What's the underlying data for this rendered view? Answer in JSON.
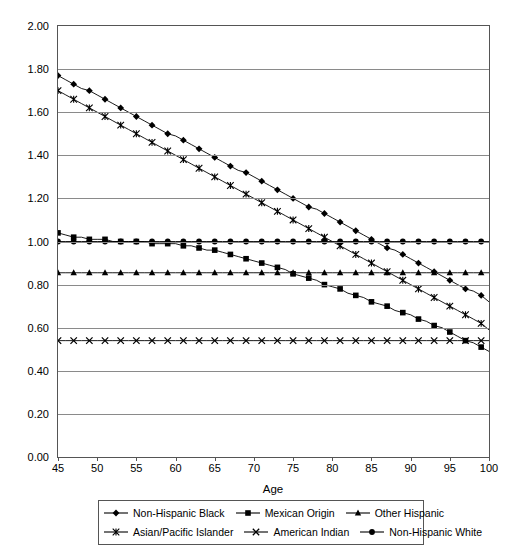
{
  "chart_data": {
    "type": "line",
    "title": "",
    "xlabel": "Age",
    "ylabel": "Hazard Ratios of Mortality",
    "xlim": [
      45,
      100
    ],
    "ylim": [
      0.0,
      2.0
    ],
    "xticks": [
      45,
      50,
      55,
      60,
      65,
      70,
      75,
      80,
      85,
      90,
      95,
      100
    ],
    "xtick_labels": [
      "45",
      "50",
      "55",
      "60",
      "65",
      "70",
      "75",
      "80",
      "85",
      "90",
      "95",
      "100"
    ],
    "yticks": [
      0.0,
      0.2,
      0.4,
      0.6,
      0.8,
      1.0,
      1.2,
      1.4,
      1.6,
      1.8,
      2.0
    ],
    "ytick_labels": [
      "0.00",
      "0.20",
      "0.40",
      "0.60",
      "0.80",
      "1.00",
      "1.20",
      "1.40",
      "1.60",
      "1.80",
      "2.00"
    ],
    "grid": "horizontal",
    "legend_position": "below",
    "legend_columns": 3,
    "marker_step_years": 1.375,
    "series": [
      {
        "name": "Non-Hispanic Black",
        "marker": "diamond",
        "color": "#000000",
        "x": [
          45,
          46,
          47,
          48,
          49,
          50,
          51,
          52,
          53,
          54,
          55,
          56,
          57,
          58,
          59,
          60,
          61,
          62,
          63,
          64,
          65,
          66,
          67,
          68,
          69,
          70,
          71,
          72,
          73,
          74,
          75,
          76,
          77,
          78,
          79,
          80,
          81,
          82,
          83,
          84,
          85,
          86,
          87,
          88,
          89,
          90,
          91,
          92,
          93,
          94,
          95,
          96,
          97,
          98,
          99,
          100
        ],
        "values": [
          1.77,
          1.75,
          1.73,
          1.71,
          1.7,
          1.68,
          1.66,
          1.64,
          1.62,
          1.6,
          1.58,
          1.56,
          1.54,
          1.52,
          1.5,
          1.49,
          1.47,
          1.45,
          1.43,
          1.41,
          1.39,
          1.37,
          1.35,
          1.33,
          1.32,
          1.3,
          1.28,
          1.26,
          1.24,
          1.22,
          1.2,
          1.18,
          1.16,
          1.15,
          1.13,
          1.11,
          1.09,
          1.07,
          1.05,
          1.03,
          1.01,
          0.99,
          0.97,
          0.96,
          0.94,
          0.92,
          0.9,
          0.88,
          0.86,
          0.84,
          0.82,
          0.8,
          0.78,
          0.77,
          0.75,
          0.72
        ]
      },
      {
        "name": "Mexican Origin",
        "marker": "square",
        "color": "#000000",
        "x": [
          45,
          46,
          47,
          48,
          49,
          50,
          51,
          52,
          53,
          54,
          55,
          56,
          57,
          58,
          59,
          60,
          61,
          62,
          63,
          64,
          65,
          66,
          67,
          68,
          69,
          70,
          71,
          72,
          73,
          74,
          75,
          76,
          77,
          78,
          79,
          80,
          81,
          82,
          83,
          84,
          85,
          86,
          87,
          88,
          89,
          90,
          91,
          92,
          93,
          94,
          95,
          96,
          97,
          98,
          99,
          100
        ],
        "values": [
          1.04,
          1.03,
          1.02,
          1.02,
          1.01,
          1.01,
          1.01,
          1.0,
          1.0,
          1.0,
          1.0,
          1.0,
          0.99,
          0.99,
          0.99,
          0.99,
          0.98,
          0.98,
          0.97,
          0.96,
          0.96,
          0.95,
          0.94,
          0.93,
          0.92,
          0.91,
          0.9,
          0.89,
          0.88,
          0.87,
          0.85,
          0.84,
          0.83,
          0.82,
          0.8,
          0.79,
          0.78,
          0.76,
          0.75,
          0.74,
          0.72,
          0.71,
          0.7,
          0.68,
          0.67,
          0.66,
          0.64,
          0.63,
          0.61,
          0.6,
          0.58,
          0.56,
          0.54,
          0.53,
          0.51,
          0.49
        ]
      },
      {
        "name": "Other Hispanic",
        "marker": "triangle",
        "color": "#000000",
        "x": [
          45,
          46,
          47,
          48,
          49,
          50,
          51,
          52,
          53,
          54,
          55,
          56,
          57,
          58,
          59,
          60,
          61,
          62,
          63,
          64,
          65,
          66,
          67,
          68,
          69,
          70,
          71,
          72,
          73,
          74,
          75,
          76,
          77,
          78,
          79,
          80,
          81,
          82,
          83,
          84,
          85,
          86,
          87,
          88,
          89,
          90,
          91,
          92,
          93,
          94,
          95,
          96,
          97,
          98,
          99,
          100
        ],
        "values": [
          0.855,
          0.855,
          0.855,
          0.855,
          0.855,
          0.855,
          0.855,
          0.855,
          0.855,
          0.855,
          0.855,
          0.855,
          0.855,
          0.855,
          0.855,
          0.855,
          0.855,
          0.855,
          0.855,
          0.855,
          0.855,
          0.855,
          0.855,
          0.855,
          0.855,
          0.855,
          0.855,
          0.855,
          0.855,
          0.855,
          0.855,
          0.855,
          0.855,
          0.855,
          0.855,
          0.855,
          0.855,
          0.855,
          0.855,
          0.855,
          0.855,
          0.855,
          0.855,
          0.855,
          0.855,
          0.855,
          0.855,
          0.855,
          0.855,
          0.855,
          0.855,
          0.855,
          0.855,
          0.855,
          0.855,
          0.855
        ]
      },
      {
        "name": "Asian/Pacific Islander",
        "marker": "asterisk",
        "color": "#000000",
        "x": [
          45,
          46,
          47,
          48,
          49,
          50,
          51,
          52,
          53,
          54,
          55,
          56,
          57,
          58,
          59,
          60,
          61,
          62,
          63,
          64,
          65,
          66,
          67,
          68,
          69,
          70,
          71,
          72,
          73,
          74,
          75,
          76,
          77,
          78,
          79,
          80,
          81,
          82,
          83,
          84,
          85,
          86,
          87,
          88,
          89,
          90,
          91,
          92,
          93,
          94,
          95,
          96,
          97,
          98,
          99,
          100
        ],
        "values": [
          1.7,
          1.68,
          1.66,
          1.64,
          1.62,
          1.6,
          1.58,
          1.56,
          1.54,
          1.52,
          1.5,
          1.48,
          1.46,
          1.44,
          1.42,
          1.4,
          1.38,
          1.36,
          1.34,
          1.32,
          1.3,
          1.28,
          1.26,
          1.24,
          1.22,
          1.2,
          1.18,
          1.16,
          1.14,
          1.12,
          1.1,
          1.08,
          1.06,
          1.04,
          1.02,
          1.0,
          0.98,
          0.96,
          0.94,
          0.92,
          0.9,
          0.88,
          0.86,
          0.84,
          0.82,
          0.8,
          0.78,
          0.76,
          0.74,
          0.72,
          0.7,
          0.68,
          0.66,
          0.64,
          0.62,
          0.59
        ]
      },
      {
        "name": "American Indian",
        "marker": "cross",
        "color": "#000000",
        "x": [
          45,
          46,
          47,
          48,
          49,
          50,
          51,
          52,
          53,
          54,
          55,
          56,
          57,
          58,
          59,
          60,
          61,
          62,
          63,
          64,
          65,
          66,
          67,
          68,
          69,
          70,
          71,
          72,
          73,
          74,
          75,
          76,
          77,
          78,
          79,
          80,
          81,
          82,
          83,
          84,
          85,
          86,
          87,
          88,
          89,
          90,
          91,
          92,
          93,
          94,
          95,
          96,
          97,
          98,
          99,
          100
        ],
        "values": [
          0.54,
          0.54,
          0.54,
          0.54,
          0.54,
          0.54,
          0.54,
          0.54,
          0.54,
          0.54,
          0.54,
          0.54,
          0.54,
          0.54,
          0.54,
          0.54,
          0.54,
          0.54,
          0.54,
          0.54,
          0.54,
          0.54,
          0.54,
          0.54,
          0.54,
          0.54,
          0.54,
          0.54,
          0.54,
          0.54,
          0.54,
          0.54,
          0.54,
          0.54,
          0.54,
          0.54,
          0.54,
          0.54,
          0.54,
          0.54,
          0.54,
          0.54,
          0.54,
          0.54,
          0.54,
          0.54,
          0.54,
          0.54,
          0.54,
          0.54,
          0.54,
          0.54,
          0.54,
          0.54,
          0.54,
          0.54
        ]
      },
      {
        "name": "Non-Hispanic White",
        "marker": "circle",
        "color": "#000000",
        "x": [
          45,
          46,
          47,
          48,
          49,
          50,
          51,
          52,
          53,
          54,
          55,
          56,
          57,
          58,
          59,
          60,
          61,
          62,
          63,
          64,
          65,
          66,
          67,
          68,
          69,
          70,
          71,
          72,
          73,
          74,
          75,
          76,
          77,
          78,
          79,
          80,
          81,
          82,
          83,
          84,
          85,
          86,
          87,
          88,
          89,
          90,
          91,
          92,
          93,
          94,
          95,
          96,
          97,
          98,
          99,
          100
        ],
        "values": [
          1.0,
          1.0,
          1.0,
          1.0,
          1.0,
          1.0,
          1.0,
          1.0,
          1.0,
          1.0,
          1.0,
          1.0,
          1.0,
          1.0,
          1.0,
          1.0,
          1.0,
          1.0,
          1.0,
          1.0,
          1.0,
          1.0,
          1.0,
          1.0,
          1.0,
          1.0,
          1.0,
          1.0,
          1.0,
          1.0,
          1.0,
          1.0,
          1.0,
          1.0,
          1.0,
          1.0,
          1.0,
          1.0,
          1.0,
          1.0,
          1.0,
          1.0,
          1.0,
          1.0,
          1.0,
          1.0,
          1.0,
          1.0,
          1.0,
          1.0,
          1.0,
          1.0,
          1.0,
          1.0,
          1.0,
          1.0
        ]
      }
    ]
  },
  "legend": {
    "rows": [
      [
        "Non-Hispanic Black",
        "Mexican Origin",
        "Other Hispanic"
      ],
      [
        "Asian/Pacific Islander",
        "American Indian",
        "Non-Hispanic White"
      ]
    ]
  }
}
